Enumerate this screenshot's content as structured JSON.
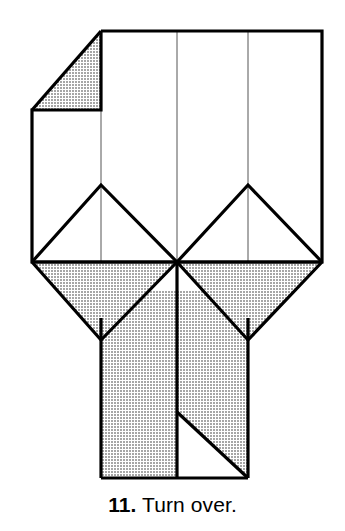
{
  "page": {
    "background_color": "#ffffff",
    "width": 345,
    "height": 531
  },
  "caption": {
    "step_number": "11.",
    "instruction": "Turn over.",
    "full_text": "11. Turn over.",
    "text_color": "#000000"
  },
  "diagram": {
    "style": {
      "paper_front_color": "#ffffff",
      "paper_back_color": "#bfbfbf",
      "edge_color": "#000000",
      "crease_color": "#555555",
      "edge_width": 3.2,
      "crease_width": 1.0
    },
    "geometry": {
      "body_top_y": 31,
      "body_bottom_y": 262,
      "body_left_x": 32,
      "body_right_x": 322,
      "corner_fold_x": 101,
      "corner_fold_y": 110,
      "center_x": 177,
      "crease_left_x": 101,
      "crease_right_x": 248,
      "peak_y": 185,
      "notch_bottom_y": 340,
      "stem_bottom_y": 478,
      "stem_left_x": 101,
      "stem_right_x": 248,
      "notch_diagonal_start_y": 412
    },
    "shapes": [
      {
        "name": "upper-body-panel",
        "fill": "paper_front",
        "note": "Main white square face of the model below the folded corner."
      },
      {
        "name": "folded-corner-triangle",
        "fill": "paper_back",
        "note": "Gray triangle at top-left where the corner is folded back revealing the reverse side."
      },
      {
        "name": "left-tent-peak",
        "fill": "paper_front",
        "note": "White triangular peak crease on the left half."
      },
      {
        "name": "right-tent-peak",
        "fill": "paper_front",
        "note": "White triangular peak crease on the right half."
      },
      {
        "name": "left-chevron-flap",
        "fill": "paper_back",
        "note": "Gray downward-pointing V flap on the left of the middle band."
      },
      {
        "name": "right-chevron-flap",
        "fill": "paper_back",
        "note": "Gray downward-pointing V flap on the right of the middle band."
      },
      {
        "name": "stem-panel",
        "fill": "paper_back",
        "note": "Gray vertical stem extending down from the body."
      },
      {
        "name": "stem-notch-triangle",
        "fill": "paper_front",
        "note": "White triangular notch in the lower right of the stem."
      }
    ],
    "creases": [
      {
        "name": "vertical-crease-left",
        "type": "crease",
        "orientation": "vertical"
      },
      {
        "name": "vertical-crease-center",
        "type": "crease",
        "orientation": "vertical"
      },
      {
        "name": "vertical-crease-right",
        "type": "crease",
        "orientation": "vertical"
      },
      {
        "name": "peak-crease-left",
        "type": "crease",
        "orientation": "diagonal"
      },
      {
        "name": "peak-crease-right",
        "type": "crease",
        "orientation": "diagonal"
      }
    ]
  }
}
